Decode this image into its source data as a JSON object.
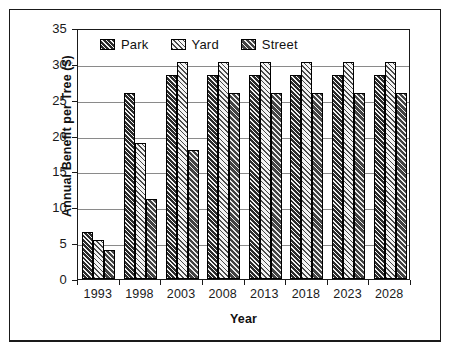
{
  "chart_data": {
    "type": "bar",
    "title": "",
    "xlabel": "Year",
    "ylabel": "Annual Benefit per Tree ($)",
    "categories": [
      "1993",
      "1998",
      "2003",
      "2008",
      "2013",
      "2018",
      "2023",
      "2028"
    ],
    "series": [
      {
        "name": "Park",
        "values": [
          6.5,
          25.9,
          28.5,
          28.5,
          28.5,
          28.5,
          28.5,
          28.5
        ]
      },
      {
        "name": "Yard",
        "values": [
          5.5,
          19.0,
          30.2,
          30.2,
          30.2,
          30.2,
          30.2,
          30.2
        ]
      },
      {
        "name": "Street",
        "values": [
          4.1,
          11.1,
          18.0,
          25.9,
          25.9,
          25.9,
          25.9,
          25.9
        ]
      }
    ],
    "ylim": [
      0,
      35
    ],
    "yticks": [
      0,
      5,
      10,
      15,
      20,
      25,
      30,
      35
    ],
    "ytick_labels": [
      "0",
      "5",
      "10",
      "15",
      "20",
      "25",
      "30",
      "35"
    ],
    "grid": true,
    "legend_position": "top-left-inside",
    "legend": [
      {
        "label": "Park",
        "pattern": "dark-diagonal-hatch",
        "color": "#3a3a3a"
      },
      {
        "label": "Yard",
        "pattern": "light-diagonal-hatch",
        "color": "#e8e8e8"
      },
      {
        "label": "Street",
        "pattern": "medium-diagonal-hatch",
        "color": "#5a5a5a"
      }
    ]
  }
}
